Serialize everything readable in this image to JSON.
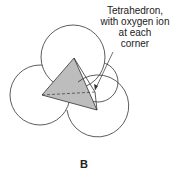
{
  "diagram": {
    "annotation": {
      "lines": [
        "Tetrahedron,",
        "with oxygen ion",
        "at each",
        "corner"
      ]
    },
    "figure_label": "B",
    "colors": {
      "stroke": "#333333",
      "tetra_fill": "#bdbdbd",
      "background": "#ffffff"
    }
  }
}
